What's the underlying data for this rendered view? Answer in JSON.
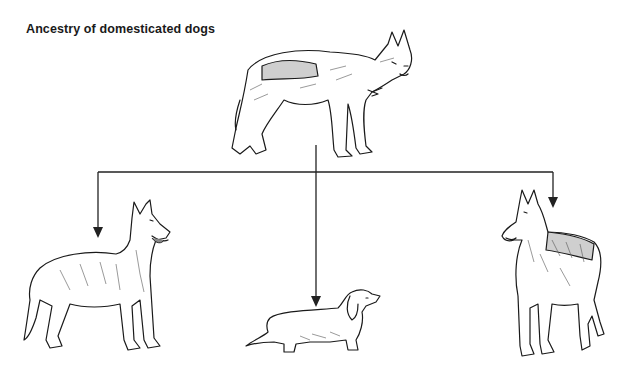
{
  "title": "Ancestry of domesticated dogs",
  "diagram": {
    "type": "tree",
    "root": {
      "id": "wolf",
      "depiction": "grey wolf illustration"
    },
    "children": [
      {
        "id": "rough-collie",
        "depiction": "long-haired shepherd/collie-type dog illustration",
        "position": "left"
      },
      {
        "id": "dachshund",
        "depiction": "dachshund illustration",
        "position": "center"
      },
      {
        "id": "shepherd-dog",
        "depiction": "short-haired upright-eared shepherd-type dog illustration",
        "position": "right"
      }
    ],
    "connector_color": "#222222"
  }
}
